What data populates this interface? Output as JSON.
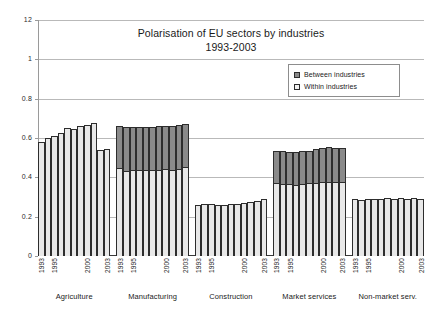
{
  "chart_data": {
    "type": "bar",
    "stacked": true,
    "title": "Polarisation of EU sectors by industries",
    "subtitle": "1993-2003",
    "xlabel": "",
    "ylabel": "",
    "ylim": [
      0,
      1.2
    ],
    "ytick_values": [
      1.2,
      1.0,
      0.8,
      0.6,
      0.4,
      0.2,
      0
    ],
    "ytick_labels": [
      "12",
      "1",
      "0.8",
      "0.6",
      "0.4",
      "0.2",
      "0"
    ],
    "grid": true,
    "legend_position": "upper right",
    "legend_entries": [
      "Between industries",
      "Within industries"
    ],
    "years": [
      "1993",
      "1994",
      "1995",
      "1996",
      "1997",
      "1998",
      "1999",
      "2000",
      "2001",
      "2002",
      "2003"
    ],
    "year_tick_labels": [
      "1993",
      "",
      "1995",
      "",
      "",
      "",
      "",
      "2000",
      "",
      "",
      "2003"
    ],
    "categories": [
      "Agriculture",
      "Manufacturing",
      "Construction",
      "Market services",
      "Non-market serv."
    ],
    "series": [
      {
        "name": "Within industries",
        "color": "#e8e8e8",
        "groups": [
          {
            "category": "Agriculture",
            "values": [
              0.58,
              0.598,
              0.612,
              0.628,
              0.65,
              0.648,
              0.662,
              0.665,
              0.678,
              0.54,
              0.545
            ]
          },
          {
            "category": "Manufacturing",
            "values": [
              0.448,
              0.432,
              0.434,
              0.437,
              0.437,
              0.437,
              0.438,
              0.44,
              0.438,
              0.442,
              0.452
            ]
          },
          {
            "category": "Construction",
            "values": [
              0.258,
              0.262,
              0.263,
              0.261,
              0.26,
              0.262,
              0.265,
              0.27,
              0.276,
              0.282,
              0.29
            ]
          },
          {
            "category": "Market services",
            "values": [
              0.368,
              0.366,
              0.363,
              0.362,
              0.363,
              0.368,
              0.372,
              0.374,
              0.376,
              0.377,
              0.376
            ]
          },
          {
            "category": "Non-market serv.",
            "values": [
              0.29,
              0.283,
              0.288,
              0.29,
              0.292,
              0.294,
              0.291,
              0.293,
              0.292,
              0.293,
              0.292
            ]
          }
        ]
      },
      {
        "name": "Between industries",
        "color": "#8a8a8a",
        "groups": [
          {
            "category": "Agriculture",
            "values": [
              0,
              0,
              0,
              0,
              0,
              0,
              0,
              0,
              0,
              0,
              0
            ]
          },
          {
            "category": "Manufacturing",
            "values": [
              0.212,
              0.226,
              0.22,
              0.218,
              0.22,
              0.22,
              0.221,
              0.222,
              0.224,
              0.222,
              0.218
            ]
          },
          {
            "category": "Construction",
            "values": [
              0,
              0,
              0,
              0,
              0,
              0,
              0,
              0,
              0,
              0,
              0
            ]
          },
          {
            "category": "Market services",
            "values": [
              0.164,
              0.166,
              0.167,
              0.169,
              0.17,
              0.168,
              0.17,
              0.175,
              0.177,
              0.173,
              0.172
            ]
          },
          {
            "category": "Non-market serv.",
            "values": [
              0,
              0,
              0,
              0,
              0,
              0,
              0,
              0,
              0,
              0,
              0
            ]
          }
        ]
      }
    ]
  },
  "colors": {
    "between": "#8a8a8a",
    "within": "#e8e8e8",
    "grid": "#b9b9b9",
    "axis": "#3a3a3a",
    "text": "#1a1a1a"
  }
}
